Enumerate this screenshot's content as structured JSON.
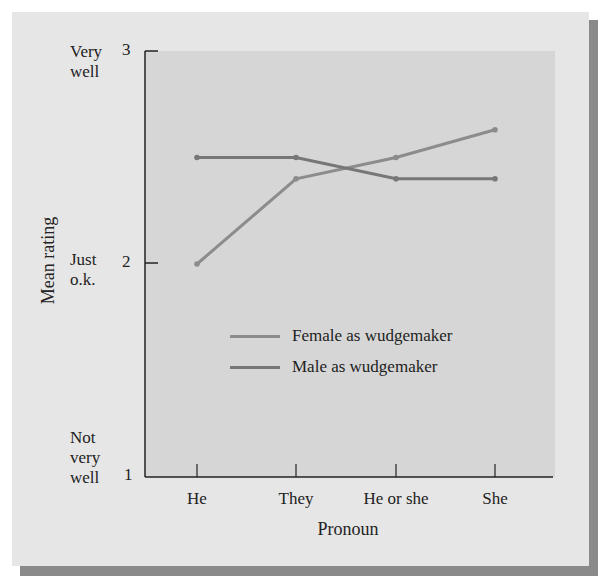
{
  "chart_data": {
    "type": "line",
    "title": "",
    "xlabel": "Pronoun",
    "ylabel": "Mean rating",
    "categories": [
      "He",
      "They",
      "He or she",
      "She"
    ],
    "series": [
      {
        "name": "Female as wudgemaker",
        "values": [
          2.0,
          2.4,
          2.5,
          2.63
        ],
        "color": "#8c8c8c"
      },
      {
        "name": "Male as wudgemaker",
        "values": [
          2.5,
          2.5,
          2.4,
          2.4
        ],
        "color": "#777777"
      }
    ],
    "ylim": [
      1,
      3
    ],
    "yticks": [
      1,
      2,
      3
    ],
    "ytick_labels": [
      "1",
      "2",
      "3"
    ],
    "ytick_descriptions": [
      "Not very well",
      "Just o.k.",
      "Very well"
    ],
    "grid": false,
    "legend_position": "center-inside"
  },
  "axis": {
    "ylabel": "Mean rating",
    "xlabel": "Pronoun",
    "yticks": {
      "t3": "3",
      "t2": "2",
      "t1": "1"
    },
    "ycats": {
      "very_well_1": "Very",
      "very_well_2": "well",
      "just_ok_1": "Just",
      "just_ok_2": "o.k.",
      "not_very_well_1": "Not",
      "not_very_well_2": "very",
      "not_very_well_3": "well"
    },
    "xticks": {
      "he": "He",
      "they": "They",
      "he_or_she": "He or she",
      "she": "She"
    }
  },
  "legend": {
    "female": "Female as wudgemaker",
    "male": "Male as wudgemaker"
  },
  "colors": {
    "female_line": "#8c8c8c",
    "male_line": "#777777",
    "panel": "#e6e6e6",
    "plot": "#d6d6d6",
    "shadow": "#8a8a8a"
  }
}
